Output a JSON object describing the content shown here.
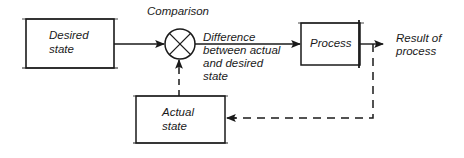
{
  "diagram": {
    "type": "feedback-control-loop",
    "nodes": {
      "desired_state": {
        "label_line1": "Desired",
        "label_line2": "state"
      },
      "comparator": {
        "label": "Comparison",
        "symbol": "circle-with-x"
      },
      "process": {
        "label": "Process"
      },
      "actual_state": {
        "label_line1": "Actual",
        "label_line2": "state"
      }
    },
    "edges": {
      "difference": {
        "line1": "Difference",
        "line2": "between actual",
        "line3": "and desired",
        "line4": "state"
      },
      "result": {
        "line1": "Result of",
        "line2": "process"
      },
      "feedback": {
        "style": "dashed"
      }
    },
    "colors": {
      "stroke": "#1a1a1a",
      "background": "#ffffff"
    }
  }
}
